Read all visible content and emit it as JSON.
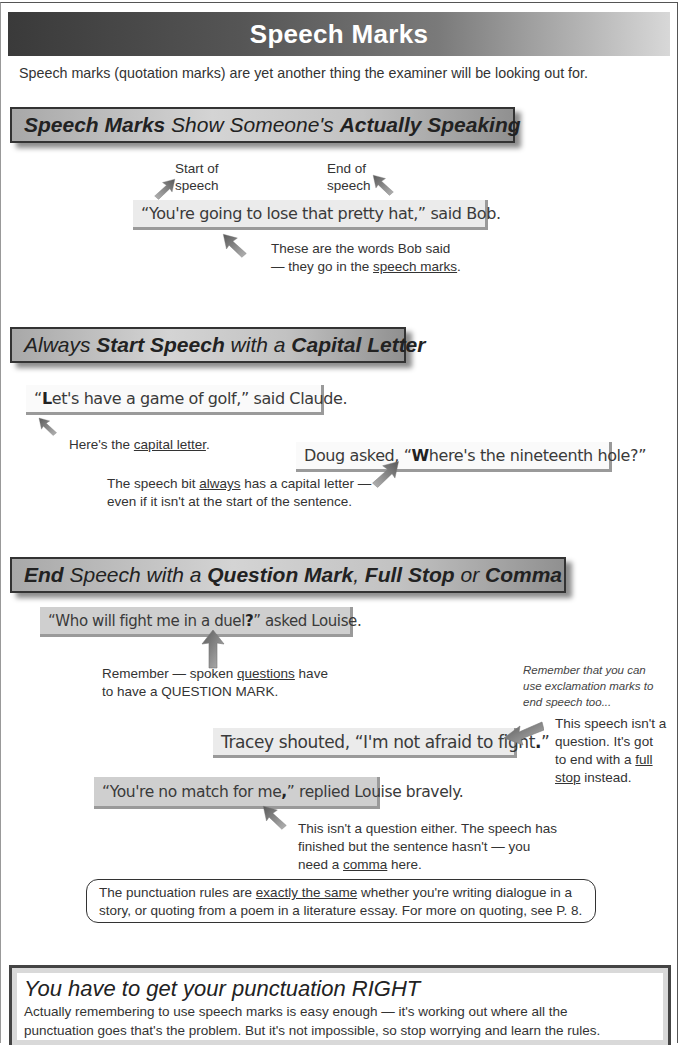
{
  "page": {
    "title": "Speech Marks",
    "intro": "Speech marks (quotation marks) are yet another thing the examiner will be looking out for."
  },
  "sections": [
    {
      "heading": [
        {
          "text": "Speech Marks",
          "bold": true
        },
        {
          "text": " Show Someone's ",
          "bold": false
        },
        {
          "text": "Actually Speaking",
          "bold": true
        }
      ],
      "examples": [
        {
          "text": "“You're going to lose that pretty hat,” said Bob."
        }
      ],
      "labels": {
        "start": "Start of speech",
        "start_line1": "Start of",
        "start_line2": "speech",
        "end_line1": "End of",
        "end_line2": "speech",
        "words_line1": "These are the words Bob said",
        "words_line2_pre": "— they go in the ",
        "words_line2_u": "speech marks",
        "words_line2_post": "."
      }
    },
    {
      "heading": [
        {
          "text": "Always ",
          "bold": false
        },
        {
          "text": "Start Speech",
          "bold": true
        },
        {
          "text": " with a ",
          "bold": false
        },
        {
          "text": "Capital Letter",
          "bold": true
        }
      ],
      "examples": [
        {
          "pre": "“",
          "hl": "L",
          "post": "et's have a game of golf,” said Claude."
        },
        {
          "pre": "Doug asked, “",
          "hl": "W",
          "post": "here's the nineteenth hole?”"
        }
      ],
      "labels": {
        "capital_pre": "Here's the ",
        "capital_u": "capital letter",
        "capital_post": ".",
        "always_pre": "The speech bit ",
        "always_u": "always",
        "always_mid": " has a capital letter —",
        "always_line2": "even if it isn't at the start of the sentence."
      }
    },
    {
      "heading": [
        {
          "text": "End",
          "bold": true
        },
        {
          "text": " Speech with a ",
          "bold": false
        },
        {
          "text": "Question Mark",
          "bold": true
        },
        {
          "text": ", ",
          "bold": false
        },
        {
          "text": "Full Stop",
          "bold": true
        },
        {
          "text": " or ",
          "bold": false
        },
        {
          "text": "Comma",
          "bold": true
        }
      ],
      "examples": [
        {
          "pre": "“Who will fight me in a duel",
          "hl": "?",
          "post": "” asked Louise."
        },
        {
          "pre": "Tracey shouted, “I'm not afraid to fight",
          "hl": ".",
          "post": "”"
        },
        {
          "pre": "“You're no match for me",
          "hl": ",",
          "post": "” replied Louise bravely."
        }
      ],
      "labels": {
        "question_pre": "Remember — spoken ",
        "question_u": "questions",
        "question_post": " have",
        "question_line2": "to have a QUESTION MARK.",
        "exclaim": "Remember that you can use exclamation marks to end speech too...",
        "exclaim_line1": "Remember that you can",
        "exclaim_line2": "use exclamation marks to",
        "exclaim_line3": "end speech too...",
        "fullstop_line1": "This speech isn't a",
        "fullstop_line2": "question.  It's got",
        "fullstop_line3_pre": "to end with a ",
        "fullstop_line3_u": "full",
        "fullstop_line4_u": "stop",
        "fullstop_line4_post": " instead.",
        "comma_line1": "This isn't a question either.  The speech has",
        "comma_line2": "finished but the sentence hasn't — you",
        "comma_line3_pre": "need a ",
        "comma_line3_u": "comma",
        "comma_line3_post": " here."
      }
    }
  ],
  "rounded_note": {
    "pre": "The punctuation rules are ",
    "u": "exactly the same",
    "post": " whether you're writing dialogue in a",
    "line2": "story, or quoting from a poem in a literature essay.  For more on quoting, see P. 8."
  },
  "summary": {
    "title": "You have to get your punctuation RIGHT",
    "line1": "Actually remembering to use speech marks is easy enough — it's working out where all the",
    "line2": "punctuation goes that's the problem.  But it's not impossible, so stop worrying and learn the rules."
  },
  "colors": {
    "title_bar_dark": "#3a3a3a",
    "title_bar_light": "#d8d8d8",
    "arrow": "#6e6e6e",
    "speech_box": "#ebebeb"
  }
}
